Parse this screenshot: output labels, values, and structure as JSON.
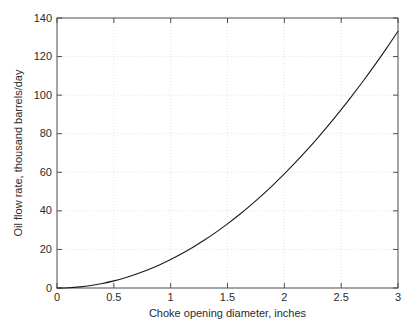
{
  "figure": {
    "background_color": "#ffffff",
    "axes_color": "#4d4d4d",
    "grid_color": "#d8d8d8",
    "curve_color": "#1a1a1a",
    "text_color": "#2b2b2b"
  },
  "chart_data": {
    "type": "line",
    "title": "",
    "xlabel": "Choke opening diameter, inches",
    "ylabel": "Oil flow rate, thousand barrels/day",
    "xlim": [
      0,
      3
    ],
    "ylim": [
      0,
      140
    ],
    "xticks": [
      0,
      0.5,
      1,
      1.5,
      2,
      2.5,
      3
    ],
    "xticklabels": [
      "0",
      "0.5",
      "1",
      "1.5",
      "2",
      "2.5",
      "3"
    ],
    "yticks": [
      0,
      20,
      40,
      60,
      80,
      100,
      120,
      140
    ],
    "yticklabels": [
      "0",
      "20",
      "40",
      "60",
      "80",
      "100",
      "120",
      "140"
    ],
    "grid": true,
    "grid_style": "dotted",
    "legend": null,
    "annotations": [],
    "series": [
      {
        "name": "Oil flow rate",
        "color": "#1a1a1a",
        "linewidth": 1.1,
        "x": [
          0,
          0.1,
          0.2,
          0.3,
          0.4,
          0.5,
          0.6,
          0.7,
          0.8,
          0.9,
          1,
          1.1,
          1.2,
          1.3,
          1.4,
          1.5,
          1.6,
          1.7,
          1.8,
          1.9,
          2,
          2.1,
          2.2,
          2.3,
          2.4,
          2.5,
          2.6,
          2.7,
          2.8,
          2.9,
          3
        ],
        "y": [
          0,
          0.15,
          0.59,
          1.33,
          2.37,
          3.7,
          5.32,
          7.25,
          9.47,
          11.98,
          14.79,
          17.89,
          21.29,
          24.99,
          28.98,
          33.27,
          37.86,
          42.74,
          47.92,
          53.39,
          59.16,
          65.23,
          71.59,
          78.25,
          85.2,
          92.45,
          100,
          107.84,
          115.98,
          124.41,
          133.14
        ]
      }
    ]
  }
}
